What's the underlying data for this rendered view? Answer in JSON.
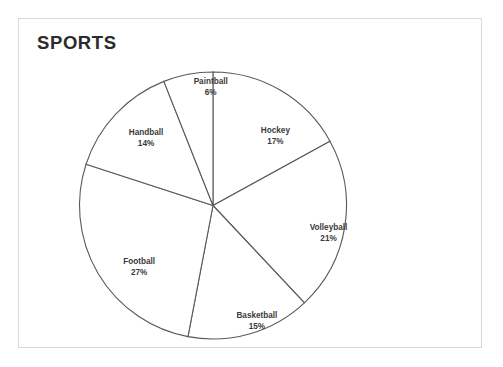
{
  "frame": {
    "background_color": "#ffffff",
    "border_color": "#d9d9d9"
  },
  "chart_title": "SPORTS",
  "chart_data": {
    "type": "pie",
    "title": "SPORTS",
    "xlabel": "",
    "ylabel": "",
    "legend_position": "none",
    "grid": false,
    "labels_inside": true,
    "start_angle_deg": 0,
    "direction": "clockwise",
    "stroke_color": "#595959",
    "slice_fill_color": "#ffffff",
    "categories": [
      "Hockey",
      "Volleyball",
      "Basketball",
      "Football",
      "Handball",
      "Paintball"
    ],
    "values": [
      17,
      21,
      15,
      27,
      14,
      6
    ],
    "unit": "%",
    "slices": [
      {
        "label": "Hockey",
        "value": 17,
        "display": "17%",
        "label_x_pct": 55.5,
        "label_y_pct": 36.0
      },
      {
        "label": "Volleyball",
        "value": 21,
        "display": "21%",
        "label_x_pct": 67.0,
        "label_y_pct": 65.5
      },
      {
        "label": "Basketball",
        "value": 15,
        "display": "15%",
        "label_x_pct": 51.5,
        "label_y_pct": 92.5
      },
      {
        "label": "Football",
        "value": 27,
        "display": "27%",
        "label_x_pct": 26.0,
        "label_y_pct": 76.0
      },
      {
        "label": "Handball",
        "value": 14,
        "display": "14%",
        "label_x_pct": 27.5,
        "label_y_pct": 36.5
      },
      {
        "label": "Paintball",
        "value": 6,
        "display": "6%",
        "label_x_pct": 41.5,
        "label_y_pct": 21.0
      }
    ]
  }
}
